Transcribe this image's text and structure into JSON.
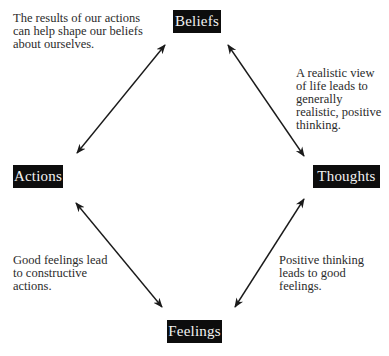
{
  "diagram": {
    "nodes": {
      "beliefs": "Beliefs",
      "actions": "Actions",
      "thoughts": "Thoughts",
      "feelings": "Feelings"
    },
    "notes": {
      "actions_to_beliefs": "The results of our actions\ncan help shape our beliefs\nabout ourselves.",
      "beliefs_to_thoughts": "A realistic view\nof life leads to\ngenerally\nrealistic, positive\nthinking.",
      "feelings_to_actions": "Good feelings lead\nto constructive\nactions.",
      "thoughts_to_feelings": "Positive thinking\nleads to good\nfeelings."
    },
    "edges": [
      {
        "from": "beliefs",
        "to": "actions",
        "bidirectional": true
      },
      {
        "from": "beliefs",
        "to": "thoughts",
        "bidirectional": true
      },
      {
        "from": "actions",
        "to": "feelings",
        "bidirectional": true
      },
      {
        "from": "thoughts",
        "to": "feelings",
        "bidirectional": true
      }
    ],
    "colors": {
      "node_bg": "#0d0d0d",
      "node_text": "#f2f2f2",
      "arrow": "#1a1a1a",
      "note_text": "#2b2b2b"
    }
  }
}
